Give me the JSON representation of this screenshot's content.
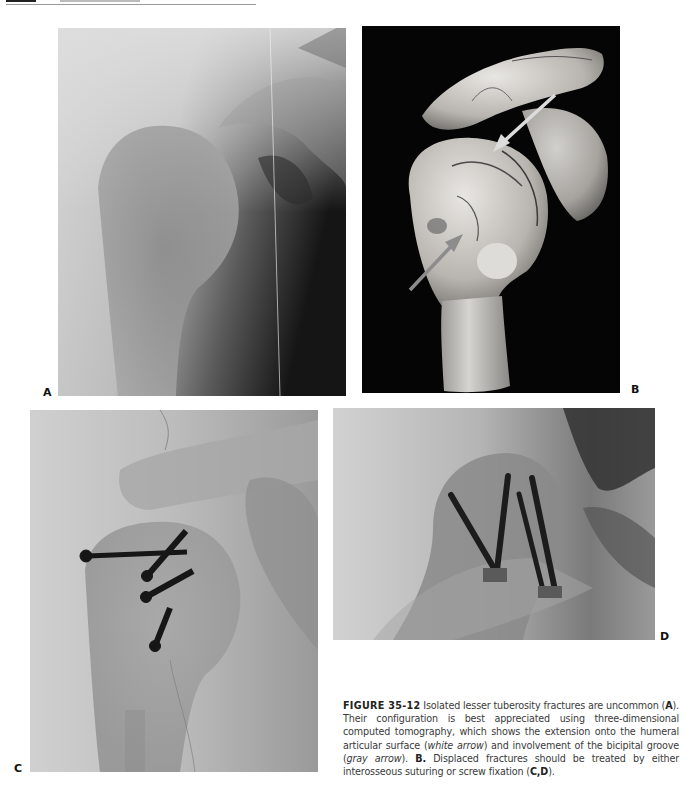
{
  "page": {
    "header": {
      "rule": true
    }
  },
  "figure": {
    "number": "FIGURE 35-12",
    "panels": [
      {
        "id": "A",
        "label": "A",
        "type": "radiograph",
        "description": "AP shoulder radiograph showing isolated lesser tuberosity fracture"
      },
      {
        "id": "B",
        "label": "B",
        "type": "3D CT reconstruction",
        "description": "Three-dimensional CT of proximal humerus with white and gray arrows",
        "arrows": [
          {
            "name": "white-arrow",
            "color": "#d9d9d9",
            "from": [
              555,
              95
            ],
            "to": [
              495,
              150
            ]
          },
          {
            "name": "gray-arrow",
            "color": "#8c8c8c",
            "from": [
              410,
              290
            ],
            "to": [
              462,
              235
            ]
          }
        ]
      },
      {
        "id": "C",
        "label": "C",
        "type": "radiograph",
        "description": "Postoperative radiograph with screw fixation (4 screws)"
      },
      {
        "id": "D",
        "label": "D",
        "type": "radiograph",
        "description": "Postoperative radiograph with screw fixation (4 screws)"
      }
    ],
    "caption": {
      "lead": "FIGURE 35-12",
      "seg1": " Isolated lesser tuberosity fractures are uncommon (",
      "a": "A",
      "seg2": "). Their configuration is best appreciated using three-dimensional computed tomography, which shows the extension onto the humeral articular surface (",
      "white_arrow": "white arrow",
      "seg3": ") and involvement of the bicipital groove (",
      "gray_arrow": "gray arrow",
      "seg4": "). ",
      "b": "B.",
      "seg5": " Displaced fractures should be treated by either interosseous suturing or screw fixation (",
      "cd": "C,D",
      "seg6": ")."
    }
  }
}
